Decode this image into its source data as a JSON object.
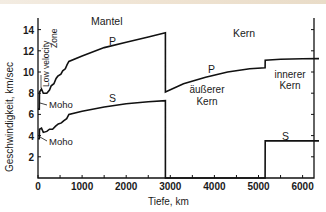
{
  "chart_data": {
    "type": "line",
    "title": "",
    "xlabel": "Tiefe, km",
    "ylabel": "Geschwindigkeit, km/sec",
    "xlim": [
      0,
      6371
    ],
    "ylim": [
      0,
      15
    ],
    "x_ticks": [
      0,
      1000,
      2000,
      3000,
      4000,
      5000,
      6000
    ],
    "x_tick_labels": [
      "0",
      "1000",
      "2000",
      "3000",
      "4000",
      "5000",
      "6000"
    ],
    "y_ticks": [
      2,
      4,
      6,
      8,
      10,
      12,
      14
    ],
    "y_tick_labels": [
      "2",
      "4",
      "6",
      "8",
      "10",
      "12",
      "14"
    ],
    "grid": false,
    "series": [
      {
        "name": "P",
        "points": [
          [
            0,
            6.5
          ],
          [
            30,
            6.5
          ],
          [
            35,
            8.1
          ],
          [
            80,
            8.4
          ],
          [
            120,
            8.0
          ],
          [
            200,
            8.0
          ],
          [
            260,
            8.3
          ],
          [
            300,
            8.7
          ],
          [
            360,
            8.9
          ],
          [
            410,
            9.4
          ],
          [
            450,
            9.6
          ],
          [
            520,
            9.8
          ],
          [
            560,
            10.1
          ],
          [
            620,
            10.3
          ],
          [
            660,
            10.7
          ],
          [
            700,
            11.0
          ],
          [
            1000,
            11.5
          ],
          [
            1500,
            12.3
          ],
          [
            2000,
            12.8
          ],
          [
            2500,
            13.3
          ],
          [
            2889,
            13.7
          ],
          [
            2890,
            8.1
          ],
          [
            3300,
            8.9
          ],
          [
            3800,
            9.5
          ],
          [
            4300,
            10.0
          ],
          [
            4800,
            10.3
          ],
          [
            5150,
            10.4
          ],
          [
            5151,
            11.1
          ],
          [
            5500,
            11.2
          ],
          [
            6000,
            11.25
          ],
          [
            6371,
            11.26
          ]
        ]
      },
      {
        "name": "S",
        "points": [
          [
            0,
            3.7
          ],
          [
            30,
            3.7
          ],
          [
            35,
            4.6
          ],
          [
            80,
            4.7
          ],
          [
            120,
            4.3
          ],
          [
            200,
            4.4
          ],
          [
            260,
            4.6
          ],
          [
            330,
            4.6
          ],
          [
            400,
            4.9
          ],
          [
            460,
            5.1
          ],
          [
            530,
            5.2
          ],
          [
            580,
            5.4
          ],
          [
            650,
            5.6
          ],
          [
            700,
            6.0
          ],
          [
            1000,
            6.3
          ],
          [
            1500,
            6.7
          ],
          [
            2000,
            7.0
          ],
          [
            2500,
            7.2
          ],
          [
            2889,
            7.3
          ],
          [
            2890,
            0
          ],
          [
            5150,
            0
          ],
          [
            5151,
            3.5
          ],
          [
            6371,
            3.5
          ]
        ]
      }
    ],
    "annotations": [
      {
        "text": "Mantel",
        "x": 1400,
        "y": 14.3
      },
      {
        "text": "Kern",
        "x": 5050,
        "y": 14.3
      },
      {
        "text": "P",
        "x": 1650,
        "y": 12.9
      },
      {
        "text": "S",
        "x": 1650,
        "y": 7.6
      },
      {
        "text": "P",
        "x": 4000,
        "y": 10.2
      },
      {
        "text": "S",
        "x": 5800,
        "y": 3.9
      },
      {
        "text": "äußerer",
        "x": 3900,
        "y": 8.7
      },
      {
        "text": "Kern",
        "x": 3900,
        "y": 7.4
      },
      {
        "text": "innerer",
        "x": 5750,
        "y": 9.9
      },
      {
        "text": "Kern",
        "x": 5750,
        "y": 8.6
      },
      {
        "text": "Moho",
        "x": 350,
        "y": 6.8
      },
      {
        "text": "Moho",
        "x": 350,
        "y": 3.4
      },
      {
        "text": "\"Low velocity Zone\"",
        "x": 180,
        "y": 11.5,
        "rotation": -90
      }
    ]
  },
  "labels": {
    "mantel": "Mantel",
    "kern": "Kern",
    "p_mantle": "P",
    "s_mantle": "S",
    "p_core": "P",
    "s_inner": "S",
    "outer_core_1": "äußerer",
    "outer_core_2": "Kern",
    "inner_core_1": "innerer",
    "inner_core_2": "Kern",
    "moho_p": "Moho",
    "moho_s": "Moho",
    "lvz_1": "Low velocity",
    "lvz_2": "Zone",
    "xlabel": "Tiefe, km",
    "ylabel": "Geschwindigkeit, km/sec"
  },
  "colors": {
    "line": "#111111",
    "text": "#1a1a1a",
    "background": "#ffffff"
  }
}
